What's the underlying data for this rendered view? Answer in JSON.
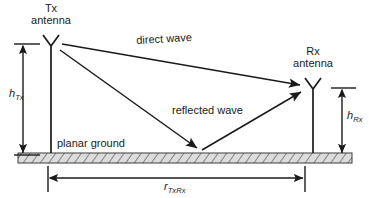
{
  "figure": {
    "colors": {
      "line": "#1a1a1a",
      "text": "#1a1a1a",
      "ground_fill": "#d9d9d9",
      "ground_hatch": "#6e6e6e",
      "background": "#ffffff"
    }
  },
  "labels": {
    "tx_antenna_line1": "Tx",
    "tx_antenna_line2": "antenna",
    "rx_antenna_line1": "Rx",
    "rx_antenna_line2": "antenna",
    "direct_wave": "direct wave",
    "reflected_wave": "reflected wave",
    "planar_ground": "planar ground",
    "h_tx_symbol": "h",
    "h_tx_subscript": "Tx",
    "h_rx_symbol": "h",
    "h_rx_subscript": "Rx",
    "r_symbol": "r",
    "r_subscript": "TxRx"
  },
  "geometry": {
    "tx_mast_x": 51,
    "rx_mast_x": 313,
    "ground_top_y": 153,
    "ground_bottom_y": 163,
    "ground_left_x": 18,
    "ground_right_x": 352,
    "tx_antenna_top_y": 35,
    "rx_antenna_top_y": 78,
    "reflection_point_x": 200,
    "h_tx_dim_x": 23,
    "h_rx_dim_x": 342,
    "r_dim_y": 178,
    "r_dim_left_x": 48,
    "r_dim_right_x": 305
  }
}
